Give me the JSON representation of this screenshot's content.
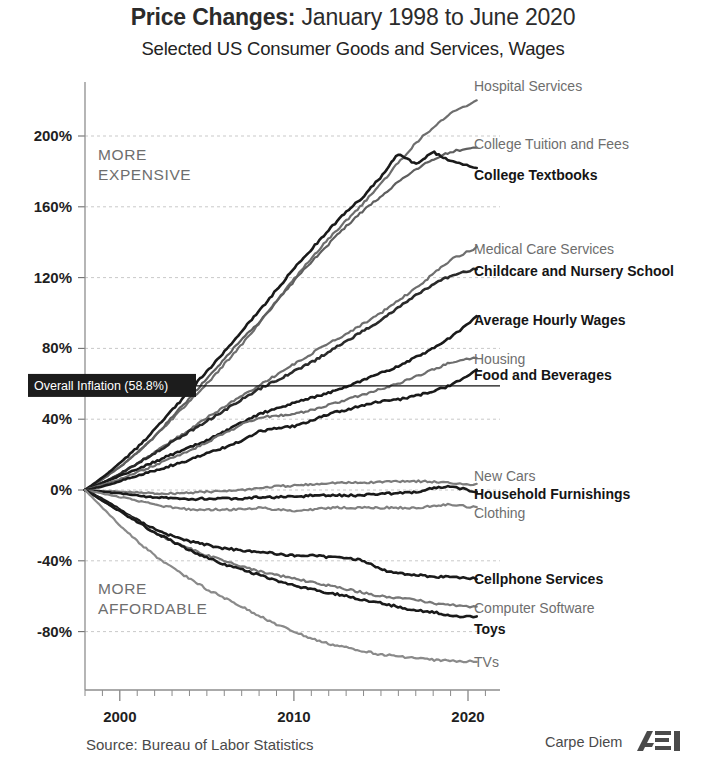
{
  "title": {
    "bold_part": "Price Changes:",
    "rest": " January 1998 to June 2020"
  },
  "subtitle": "Selected US Consumer Goods and Services, Wages",
  "annotations": {
    "more_expensive_line1": "MORE",
    "more_expensive_line2": "EXPENSIVE",
    "more_affordable_line1": "MORE",
    "more_affordable_line2": "AFFORDABLE",
    "overall_inflation_label": "Overall Inflation (58.8%)"
  },
  "footer": {
    "source": "Source: Bureau of Labor Statistics",
    "brand": "Carpe Diem",
    "logo": "AEI"
  },
  "chart_data": {
    "type": "line",
    "title": "Price Changes: January 1998 to June 2020",
    "subtitle": "Selected US Consumer Goods and Services, Wages",
    "xlabel": "",
    "ylabel": "",
    "xlim": [
      1998.0,
      2020.5
    ],
    "ylim": [
      -105,
      230
    ],
    "grid": true,
    "legend_position": "right-inline-labels",
    "x_ticks": [
      "2000",
      "2010",
      "2020"
    ],
    "x_tick_values": [
      2000,
      2010,
      2020
    ],
    "y_ticks": [
      "200%",
      "160%",
      "120%",
      "80%",
      "40%",
      "0%",
      "-40%",
      "-80%"
    ],
    "y_tick_values": [
      200,
      160,
      120,
      80,
      40,
      0,
      -40,
      -80
    ],
    "reference_line": {
      "label": "Overall Inflation (58.8%)",
      "value": 58.8
    },
    "x": [
      1998.0,
      1999.0,
      2000.0,
      2001.0,
      2002.0,
      2003.0,
      2004.0,
      2005.0,
      2006.0,
      2007.0,
      2008.0,
      2009.0,
      2010.0,
      2011.0,
      2012.0,
      2013.0,
      2014.0,
      2015.0,
      2016.0,
      2017.0,
      2018.0,
      2019.0,
      2020.5
    ],
    "series": [
      {
        "name": "Hospital Services",
        "label_style": "light",
        "color": "#6e6e6e",
        "final_value": 220,
        "values": [
          0,
          6,
          13,
          21,
          30,
          40,
          50,
          60,
          71,
          82,
          94,
          107,
          119,
          131,
          142,
          152,
          162,
          173,
          185,
          196,
          205,
          213,
          220
        ]
      },
      {
        "name": "College Tuition and Fees",
        "label_style": "light",
        "color": "#5f5f5f",
        "final_value": 194,
        "values": [
          0,
          6,
          13,
          21,
          30,
          41,
          52,
          63,
          74,
          85,
          95,
          106,
          118,
          129,
          139,
          149,
          158,
          166,
          174,
          181,
          187,
          191,
          194
        ]
      },
      {
        "name": "College Textbooks",
        "label_style": "dark",
        "color": "#1a1a1a",
        "final_value": 182,
        "values": [
          0,
          7,
          15,
          24,
          34,
          45,
          56,
          67,
          78,
          90,
          101,
          113,
          125,
          136,
          147,
          157,
          166,
          177,
          190,
          184,
          191,
          186,
          182
        ]
      },
      {
        "name": "Medical Care Services",
        "label_style": "light",
        "color": "#6e6e6e",
        "final_value": 137,
        "values": [
          0,
          4,
          9,
          15,
          21,
          28,
          34,
          41,
          47,
          53,
          59,
          65,
          71,
          77,
          83,
          88,
          94,
          100,
          107,
          114,
          122,
          130,
          137
        ]
      },
      {
        "name": "Childcare and Nursery School",
        "label_style": "dark",
        "color": "#2a2a2a",
        "final_value": 125,
        "values": [
          0,
          4,
          9,
          15,
          21,
          27,
          33,
          39,
          45,
          51,
          57,
          62,
          67,
          72,
          78,
          84,
          90,
          96,
          103,
          110,
          116,
          121,
          125
        ]
      },
      {
        "name": "Average Hourly Wages",
        "label_style": "dark",
        "color": "#1a1a1a",
        "final_value": 98,
        "values": [
          0,
          4,
          8,
          12,
          16,
          20,
          24,
          28,
          33,
          38,
          43,
          46,
          49,
          52,
          55,
          58,
          62,
          66,
          70,
          75,
          80,
          86,
          98
        ]
      },
      {
        "name": "Housing",
        "label_style": "light",
        "color": "#6e6e6e",
        "final_value": 75,
        "values": [
          0,
          3,
          6,
          10,
          14,
          18,
          22,
          27,
          32,
          37,
          41,
          42,
          43,
          45,
          48,
          51,
          54,
          57,
          60,
          64,
          68,
          72,
          75
        ]
      },
      {
        "name": "Food and Beverages",
        "label_style": "dark",
        "color": "#1a1a1a",
        "final_value": 68,
        "values": [
          0,
          2,
          5,
          8,
          11,
          14,
          17,
          21,
          24,
          28,
          33,
          35,
          36,
          39,
          43,
          45,
          48,
          50,
          51,
          53,
          56,
          59,
          68
        ]
      },
      {
        "name": "New Cars",
        "label_style": "light",
        "color": "#7b7b7b",
        "final_value": 3,
        "values": [
          0,
          -0.5,
          -1,
          -1.5,
          -2,
          -2,
          -1.5,
          -1,
          -0.5,
          0,
          1,
          2,
          2.5,
          3,
          4,
          4,
          4,
          4.5,
          5,
          5,
          4.5,
          4,
          3
        ]
      },
      {
        "name": "Household Furnishings",
        "label_style": "dark",
        "color": "#1a1a1a",
        "final_value": -1,
        "values": [
          0,
          -1,
          -2,
          -3,
          -4,
          -5,
          -5,
          -5,
          -5,
          -5,
          -4,
          -4,
          -4,
          -3,
          -3,
          -3,
          -3,
          -2,
          -2,
          -1,
          1,
          2,
          -1
        ]
      },
      {
        "name": "Clothing",
        "label_style": "light",
        "color": "#808080",
        "final_value": -10,
        "values": [
          0,
          -2,
          -4,
          -6,
          -8,
          -10,
          -11,
          -11,
          -11,
          -11,
          -10,
          -11,
          -12,
          -11,
          -10,
          -10,
          -10,
          -10,
          -10,
          -10,
          -9,
          -8,
          -10
        ]
      },
      {
        "name": "Cellphone Services",
        "label_style": "dark",
        "color": "#1a1a1a",
        "final_value": -50,
        "values": [
          0,
          -5,
          -11,
          -17,
          -22,
          -26,
          -29,
          -31,
          -33,
          -34,
          -35,
          -36,
          -37,
          -37,
          -38,
          -38,
          -40,
          -45,
          -47,
          -48,
          -49,
          -49,
          -50
        ]
      },
      {
        "name": "Computer Software",
        "label_style": "light",
        "color": "#787878",
        "final_value": -66,
        "values": [
          0,
          -6,
          -12,
          -18,
          -24,
          -29,
          -33,
          -37,
          -40,
          -43,
          -46,
          -48,
          -50,
          -52,
          -54,
          -56,
          -58,
          -60,
          -61,
          -62,
          -64,
          -65,
          -66
        ]
      },
      {
        "name": "Toys",
        "label_style": "dark",
        "color": "#1a1a1a",
        "final_value": -72,
        "values": [
          0,
          -6,
          -12,
          -18,
          -24,
          -29,
          -34,
          -38,
          -42,
          -45,
          -48,
          -51,
          -54,
          -56,
          -58,
          -60,
          -62,
          -64,
          -66,
          -68,
          -69,
          -71,
          -72
        ]
      },
      {
        "name": "TVs",
        "label_style": "light",
        "color": "#8a8a8a",
        "final_value": -97,
        "values": [
          0,
          -10,
          -20,
          -29,
          -37,
          -44,
          -50,
          -56,
          -61,
          -66,
          -71,
          -76,
          -80,
          -84,
          -87,
          -89,
          -91,
          -93,
          -94,
          -95,
          -96,
          -96.5,
          -97
        ]
      }
    ]
  }
}
